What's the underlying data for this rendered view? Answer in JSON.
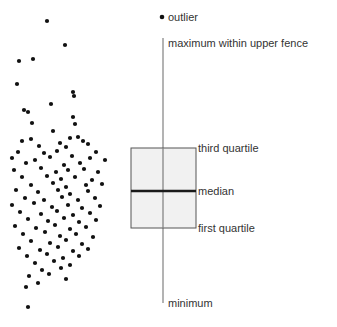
{
  "figure": {
    "type": "annotated-boxplot-with-stripplot",
    "background": "#ffffff",
    "width": 337,
    "height": 327
  },
  "style": {
    "dot_color": "#111111",
    "dot_radius": 2.1,
    "box_fill": "#f0f0f0",
    "box_stroke": "#555555",
    "whisker_color": "#808080",
    "median_color": "#1a1a1a",
    "label_color": "#333333",
    "label_font_size": 11
  },
  "annotations": [
    {
      "key": "outlier",
      "label": "outlier",
      "x": 168,
      "y": 11
    },
    {
      "key": "upper_fence",
      "label": "maximum within upper fence",
      "x": 168,
      "y": 37
    },
    {
      "key": "q3",
      "label": "third quartile",
      "x": 198,
      "y": 142
    },
    {
      "key": "median",
      "label": "median",
      "x": 198,
      "y": 185
    },
    {
      "key": "q1",
      "label": "first quartile",
      "x": 198,
      "y": 222
    },
    {
      "key": "minimum",
      "label": "minimum",
      "x": 168,
      "y": 297
    }
  ],
  "chart_data": {
    "type": "boxplot",
    "title": "",
    "xlabel": "",
    "ylabel": "",
    "orientation": "vertical",
    "grid": false,
    "legend": "none",
    "axis_note": "Vertical pixel axis; larger value = higher on page (y inverted)",
    "box": {
      "center_x": 163,
      "left": 131,
      "right": 196,
      "q3_y": 148,
      "median_y": 191,
      "q1_y": 228,
      "upper_fence_y": 38,
      "lower_fence_y": 303
    },
    "outliers": [
      {
        "x": 162,
        "y": 17
      }
    ],
    "strip_plot": {
      "note": "Raw data points shown at left of the box plot",
      "count": 112,
      "points": [
        [
          47,
          21
        ],
        [
          65,
          45
        ],
        [
          19,
          61
        ],
        [
          33,
          59
        ],
        [
          17,
          84
        ],
        [
          74,
          96
        ],
        [
          24,
          110
        ],
        [
          28,
          112
        ],
        [
          51,
          104
        ],
        [
          73,
          92
        ],
        [
          73,
          117
        ],
        [
          75,
          124
        ],
        [
          32,
          123
        ],
        [
          53,
          131
        ],
        [
          31,
          139
        ],
        [
          70,
          138
        ],
        [
          78,
          137
        ],
        [
          22,
          141
        ],
        [
          39,
          146
        ],
        [
          60,
          143
        ],
        [
          83,
          141
        ],
        [
          66,
          147
        ],
        [
          88,
          144
        ],
        [
          18,
          152
        ],
        [
          44,
          153
        ],
        [
          57,
          151
        ],
        [
          96,
          152
        ],
        [
          12,
          158
        ],
        [
          35,
          160
        ],
        [
          50,
          157
        ],
        [
          72,
          156
        ],
        [
          90,
          158
        ],
        [
          26,
          163
        ],
        [
          64,
          165
        ],
        [
          80,
          163
        ],
        [
          105,
          160
        ],
        [
          14,
          170
        ],
        [
          41,
          168
        ],
        [
          56,
          172
        ],
        [
          68,
          170
        ],
        [
          84,
          169
        ],
        [
          98,
          172
        ],
        [
          22,
          177
        ],
        [
          47,
          176
        ],
        [
          61,
          179
        ],
        [
          75,
          177
        ],
        [
          92,
          180
        ],
        [
          31,
          185
        ],
        [
          53,
          183
        ],
        [
          66,
          187
        ],
        [
          86,
          185
        ],
        [
          102,
          184
        ],
        [
          16,
          190
        ],
        [
          38,
          192
        ],
        [
          58,
          190
        ],
        [
          70,
          194
        ],
        [
          88,
          191
        ],
        [
          25,
          198
        ],
        [
          44,
          200
        ],
        [
          62,
          197
        ],
        [
          78,
          200
        ],
        [
          95,
          198
        ],
        [
          12,
          205
        ],
        [
          34,
          203
        ],
        [
          52,
          207
        ],
        [
          68,
          205
        ],
        [
          82,
          208
        ],
        [
          100,
          206
        ],
        [
          20,
          212
        ],
        [
          41,
          214
        ],
        [
          57,
          211
        ],
        [
          73,
          215
        ],
        [
          90,
          213
        ],
        [
          28,
          219
        ],
        [
          48,
          221
        ],
        [
          64,
          218
        ],
        [
          79,
          222
        ],
        [
          96,
          220
        ],
        [
          15,
          226
        ],
        [
          36,
          228
        ],
        [
          55,
          225
        ],
        [
          70,
          229
        ],
        [
          86,
          227
        ],
        [
          23,
          234
        ],
        [
          45,
          232
        ],
        [
          60,
          236
        ],
        [
          76,
          234
        ],
        [
          93,
          237
        ],
        [
          31,
          241
        ],
        [
          50,
          243
        ],
        [
          66,
          240
        ],
        [
          82,
          244
        ],
        [
          19,
          248
        ],
        [
          40,
          250
        ],
        [
          58,
          247
        ],
        [
          73,
          251
        ],
        [
          88,
          249
        ],
        [
          27,
          256
        ],
        [
          47,
          254
        ],
        [
          63,
          258
        ],
        [
          79,
          256
        ],
        [
          35,
          263
        ],
        [
          54,
          261
        ],
        [
          70,
          265
        ],
        [
          42,
          270
        ],
        [
          61,
          268
        ],
        [
          29,
          276
        ],
        [
          49,
          274
        ],
        [
          66,
          279
        ],
        [
          38,
          283
        ],
        [
          26,
          287
        ],
        [
          28,
          307
        ]
      ]
    }
  }
}
